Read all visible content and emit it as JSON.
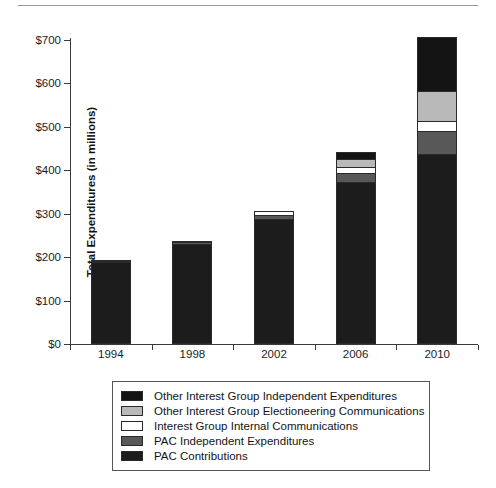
{
  "figure": {
    "clipped_title": "",
    "ylabel": "Total Expenditures (in millions)"
  },
  "chart_data": {
    "type": "bar",
    "stacked": true,
    "title": "",
    "xlabel": "",
    "ylabel": "Total Expenditures (in millions)",
    "categories": [
      "1994",
      "1998",
      "2002",
      "2006",
      "2010"
    ],
    "ylim": [
      0,
      700
    ],
    "yticks": [
      0,
      100,
      200,
      300,
      400,
      500,
      600,
      700
    ],
    "ytick_labels": [
      "$0",
      "$100",
      "$200",
      "$300",
      "$400",
      "$500",
      "$600",
      "$700"
    ],
    "grid": false,
    "legend_position": "below-plot",
    "series": [
      {
        "name": "PAC Contributions",
        "color": "#1c1c1c",
        "values": [
          189,
          230,
          288,
          373,
          437
        ]
      },
      {
        "name": "PAC Independent Expenditures",
        "color": "#585858",
        "values": [
          3,
          4,
          10,
          21,
          53
        ]
      },
      {
        "name": "Interest Group Internal Communications",
        "color": "#ffffff",
        "values": [
          2,
          3,
          9,
          13,
          24
        ]
      },
      {
        "name": "Other Interest Group Electioneering Communications",
        "color": "#b9b9b9",
        "values": [
          0,
          0,
          0,
          18,
          69
        ]
      },
      {
        "name": "Other Interest Group Independent Expenditures",
        "color": "#141414",
        "values": [
          0,
          0,
          0,
          18,
          124
        ]
      }
    ],
    "totals": [
      194,
      237,
      307,
      443,
      707
    ]
  },
  "legend": {
    "items": [
      {
        "label": "Other Interest Group Independent Expenditures",
        "color": "#141414"
      },
      {
        "label": "Other Interest Group Electioneering Communications",
        "color": "#b9b9b9"
      },
      {
        "label": "Interest Group Internal Communications",
        "color": "#ffffff"
      },
      {
        "label": "PAC Independent Expenditures",
        "color": "#585858"
      },
      {
        "label": "PAC Contributions",
        "color": "#1c1c1c"
      }
    ]
  }
}
